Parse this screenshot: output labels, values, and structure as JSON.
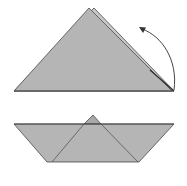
{
  "diagram": {
    "title": "",
    "steps": [
      {
        "name": "fold-step",
        "description": "Triangle with back layer; arrow indicates folding a corner up"
      },
      {
        "name": "result-step",
        "description": "Folded paper boat shape"
      }
    ],
    "colors": {
      "paper_fill": "#b5b5b5",
      "back_layer_fill": "#c8c8c8",
      "edge": "#4a4a4a",
      "arrow": "#444444",
      "background": "#ffffff"
    }
  }
}
